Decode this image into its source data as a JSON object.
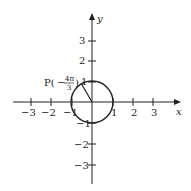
{
  "diagram": {
    "type": "unit-circle",
    "axes": {
      "x_label": "x",
      "y_label": "y"
    },
    "x_ticks": [
      "−3",
      "−2",
      "−1",
      "1",
      "2",
      "3"
    ],
    "y_ticks": [
      "3",
      "2",
      "1",
      "−1",
      "−2",
      "−3"
    ],
    "point": {
      "label_prefix": "P(",
      "sign": "−",
      "numerator": "4π",
      "denominator": "3",
      "label_suffix": ")",
      "angle": "-4π/3",
      "coords": [
        -0.5,
        0.866
      ]
    },
    "circle_radius": 1,
    "colors": {
      "stroke": "#222222",
      "background": "#ffffff"
    }
  }
}
